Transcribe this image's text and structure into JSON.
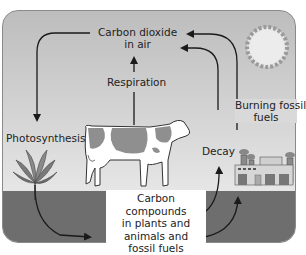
{
  "diagram": {
    "nodes": {
      "air": {
        "line1": "Carbon dioxide",
        "line2": "in air"
      },
      "compounds": {
        "line1": "Carbon compounds",
        "line2": "in plants and",
        "line3": "animals and",
        "line4": "fossil fuels"
      }
    },
    "processes": {
      "respiration": "Respiration",
      "photosynthesis": "Photosynthesis",
      "decay": "Decay",
      "burning_line1": "Burning fossil",
      "burning_line2": "fuels"
    },
    "icons": [
      "sun-icon",
      "cow-icon",
      "plant-icon",
      "factory-icon"
    ],
    "colors": {
      "sky_top": "#bdbdbd",
      "sky_bottom": "#e6e6e6",
      "ground": "#6e6e6e",
      "arrow": "#1a1a1a",
      "box": "#ffffff"
    }
  }
}
